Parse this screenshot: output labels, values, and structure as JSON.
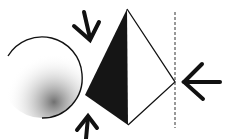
{
  "diagram": {
    "shapes": {
      "circle": {
        "cx": 42,
        "cy": 78,
        "r": 40,
        "shading": "stippled lower-right"
      },
      "pyramid": {
        "apex": [
          127,
          9
        ],
        "left": [
          85,
          95
        ],
        "bottom": [
          128,
          125
        ],
        "right": [
          175,
          82
        ],
        "shaded_face": "left"
      },
      "line": {
        "x": 175,
        "y1": 12,
        "y2": 128,
        "style": "dashed vertical"
      }
    },
    "arrows": [
      {
        "name": "top",
        "direction": "down-right",
        "at": [
          95,
          38
        ]
      },
      {
        "name": "bottom",
        "direction": "up",
        "at": [
          88,
          115
        ]
      },
      {
        "name": "right",
        "direction": "left",
        "at": [
          190,
          82
        ]
      }
    ],
    "colors": {
      "ink": "#111111",
      "background": "#ffffff"
    }
  }
}
